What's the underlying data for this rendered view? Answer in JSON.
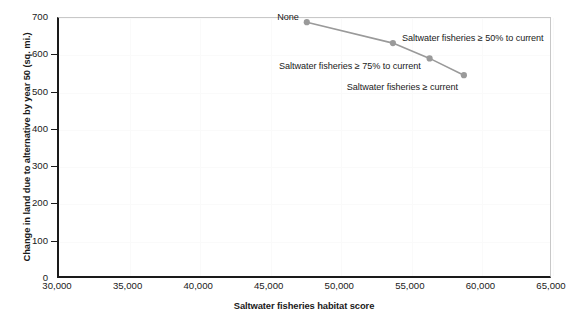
{
  "chart_data": {
    "type": "line",
    "title": "",
    "xlabel": "Saltwater fisheries habitat score",
    "ylabel": "Change in land due to alternative by year 50 (sq. mi.)",
    "xlim": [
      30000,
      65000
    ],
    "ylim": [
      0,
      700
    ],
    "xticks": [
      "30,000",
      "35,000",
      "40,000",
      "45,000",
      "50,000",
      "55,000",
      "60,000",
      "65,000"
    ],
    "xtick_values": [
      30000,
      35000,
      40000,
      45000,
      50000,
      55000,
      60000,
      65000
    ],
    "yticks": [
      "0",
      "100",
      "200",
      "300",
      "400",
      "500",
      "600",
      "700"
    ],
    "ytick_values": [
      0,
      100,
      200,
      300,
      400,
      500,
      600,
      700
    ],
    "grid": true,
    "legend": "none",
    "series": [
      {
        "name": "Alternatives",
        "color": "#9a9a9a",
        "marker": "circle",
        "points": [
          {
            "label": "None",
            "x": 47700,
            "y": 686
          },
          {
            "label": "Saltwater fisheries ≥ 50% to current",
            "x": 53800,
            "y": 630
          },
          {
            "label": "Saltwater fisheries ≥ 75% to current",
            "x": 56400,
            "y": 589
          },
          {
            "label": "Saltwater fisheries ≥ current",
            "x": 58830,
            "y": 544
          }
        ]
      }
    ],
    "annotations": [
      {
        "text": "None",
        "point_index": 0,
        "align": "right"
      },
      {
        "text": "Saltwater fisheries ≥ 50% to current",
        "point_index": 1,
        "align": "left"
      },
      {
        "text": "Saltwater fisheries ≥ 75% to current",
        "point_index": 2,
        "align": "right"
      },
      {
        "text": "Saltwater fisheries ≥ current",
        "point_index": 3,
        "align": "right"
      }
    ]
  },
  "colors": {
    "series": "#9a9a9a",
    "axis": "#1a1a1a",
    "grid": "#fafafa",
    "frame": "#c8c8c8",
    "background": "#ffffff",
    "text": "#1a1a1a"
  }
}
